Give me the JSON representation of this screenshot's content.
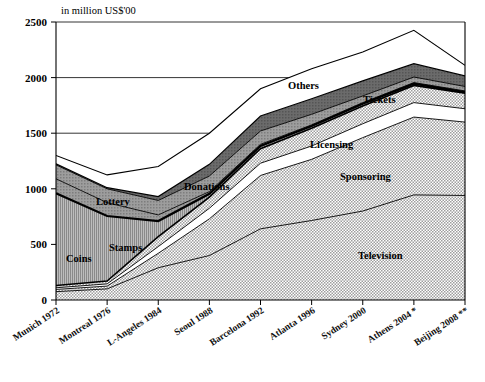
{
  "chart_data": {
    "type": "area",
    "title": "",
    "subtitle": "",
    "axis_note": "in million US$'00",
    "xlabel": "",
    "ylabel": "in million US$'00",
    "ylim": [
      0,
      2500
    ],
    "yticks": [
      0,
      500,
      1000,
      1500,
      2000,
      2500
    ],
    "ytick_labels": [
      "0",
      "500",
      "1000",
      "1500",
      "2000",
      "2500"
    ],
    "grid": true,
    "legend_position": "inline-labels",
    "stacked": true,
    "categories": [
      "Munich 1972",
      "Montreal 1976",
      "L-Angeles 1984",
      "Seoul  1988",
      "Barcelona 1992",
      "Atlanta 1996",
      "Sydney 2000",
      "Athens 2004 *",
      "Beijing 2008 **"
    ],
    "series": [
      {
        "name": "Television",
        "values": [
          75,
          100,
          290,
          400,
          640,
          715,
          800,
          945,
          940
        ]
      },
      {
        "name": "Sponsoring",
        "values": [
          20,
          25,
          130,
          330,
          480,
          550,
          660,
          700,
          660
        ]
      },
      {
        "name": "Licensing",
        "values": [
          15,
          20,
          60,
          95,
          110,
          120,
          125,
          130,
          120
        ]
      },
      {
        "name": "Tickets",
        "values": [
          20,
          25,
          90,
          100,
          130,
          160,
          160,
          155,
          140
        ]
      },
      {
        "name": "Coins",
        "values": [
          830,
          585,
          140,
          30,
          25,
          20,
          20,
          15,
          10
        ]
      },
      {
        "name": "Stamps",
        "values": [
          130,
          120,
          55,
          20,
          15,
          10,
          10,
          10,
          10
        ]
      },
      {
        "name": "Lottery",
        "values": [
          125,
          125,
          130,
          140,
          120,
          95,
          60,
          50,
          40
        ]
      },
      {
        "name": "Donations",
        "values": [
          10,
          10,
          35,
          105,
          135,
          140,
          135,
          120,
          95
        ]
      },
      {
        "name": "Others",
        "values": [
          75,
          115,
          270,
          280,
          245,
          270,
          260,
          300,
          95
        ]
      }
    ],
    "totals": [
      1300,
      1125,
      1200,
      1500,
      1900,
      2080,
      2230,
      2425,
      2110
    ],
    "annotations": [
      {
        "text": "Others",
        "x": 288,
        "y": 89
      },
      {
        "text": "Tickets",
        "x": 363,
        "y": 103
      },
      {
        "text": "Licensing",
        "x": 310,
        "y": 148
      },
      {
        "text": "Sponsoring",
        "x": 340,
        "y": 180
      },
      {
        "text": "Television",
        "x": 358,
        "y": 259
      },
      {
        "text": "Lottery",
        "x": 96,
        "y": 205
      },
      {
        "text": "Stamps",
        "x": 109,
        "y": 251
      },
      {
        "text": "Coins",
        "x": 66,
        "y": 262
      },
      {
        "text": "Donations",
        "x": 184,
        "y": 190
      }
    ]
  },
  "colors": {
    "axis": "#000000",
    "grid": "#000000",
    "background": "#ffffff",
    "television": "#d9d9d9",
    "sponsoring": "#d9d9d9",
    "licensing": "#ffffff",
    "tickets": "#d9d9d9",
    "coins": "#9a9a9a",
    "stamps": "#9a9a9a",
    "lottery": "#9a9a9a",
    "donations": "#6f6f6f",
    "others": "#ffffff"
  }
}
